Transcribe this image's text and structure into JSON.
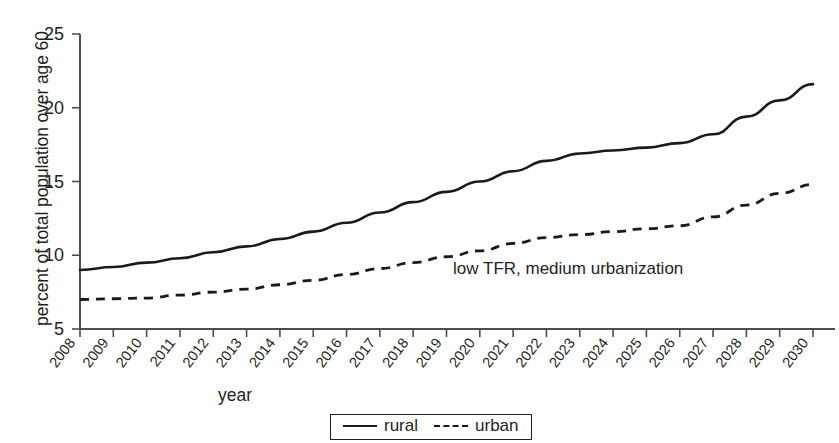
{
  "chart_data": {
    "type": "line",
    "title": "",
    "xlabel": "year",
    "ylabel": "percent of total population over age 60",
    "x": [
      2008,
      2009,
      2010,
      2011,
      2012,
      2013,
      2014,
      2015,
      2016,
      2017,
      2018,
      2019,
      2020,
      2021,
      2022,
      2023,
      2024,
      2025,
      2026,
      2027,
      2028,
      2029,
      2030
    ],
    "categories": [
      "2008",
      "2009",
      "2010",
      "2011",
      "2012",
      "2013",
      "2014",
      "2015",
      "2016",
      "2017",
      "2018",
      "2019",
      "2020",
      "2021",
      "2022",
      "2023",
      "2024",
      "2025",
      "2026",
      "2027",
      "2028",
      "2029",
      "2030"
    ],
    "series": [
      {
        "name": "rural",
        "style": "solid",
        "values": [
          9.0,
          9.2,
          9.5,
          9.8,
          10.2,
          10.6,
          11.1,
          11.6,
          12.2,
          12.9,
          13.6,
          14.3,
          15.0,
          15.7,
          16.4,
          16.9,
          17.1,
          17.3,
          17.6,
          18.2,
          19.4,
          20.5,
          21.6
        ]
      },
      {
        "name": "urban",
        "style": "dashed",
        "values": [
          7.0,
          7.05,
          7.1,
          7.3,
          7.5,
          7.7,
          8.0,
          8.3,
          8.7,
          9.1,
          9.5,
          9.9,
          10.3,
          10.8,
          11.2,
          11.4,
          11.6,
          11.8,
          12.0,
          12.6,
          13.4,
          14.2,
          14.8
        ]
      }
    ],
    "yticks": [
      5,
      10,
      15,
      20,
      25
    ],
    "ylim": [
      5,
      25
    ],
    "xlim": [
      2008,
      2030
    ],
    "grid": false,
    "legend_position": "bottom-center",
    "legend_entries": [
      "rural",
      "urban"
    ],
    "annotations": [
      {
        "text": "low TFR, medium urbanization",
        "x": 2024,
        "y": 8.9
      }
    ]
  },
  "axes": {
    "y_label": "percent of total population over age 60",
    "x_label": "year",
    "y_ticks": [
      "25",
      "20",
      "15",
      "10",
      "5"
    ],
    "x_ticks": [
      "2008",
      "2009",
      "2010",
      "2011",
      "2012",
      "2013",
      "2014",
      "2015",
      "2016",
      "2017",
      "2018",
      "2019",
      "2020",
      "2021",
      "2022",
      "2023",
      "2024",
      "2025",
      "2026",
      "2027",
      "2028",
      "2029",
      "2030"
    ]
  },
  "legend": {
    "rural_label": "rural",
    "urban_label": "urban"
  },
  "annotation": {
    "text": "low TFR, medium urbanization"
  },
  "colors": {
    "line": "#1a1a1a",
    "axis": "#4d4d4f",
    "text": "#231f20",
    "background": "#ffffff"
  }
}
